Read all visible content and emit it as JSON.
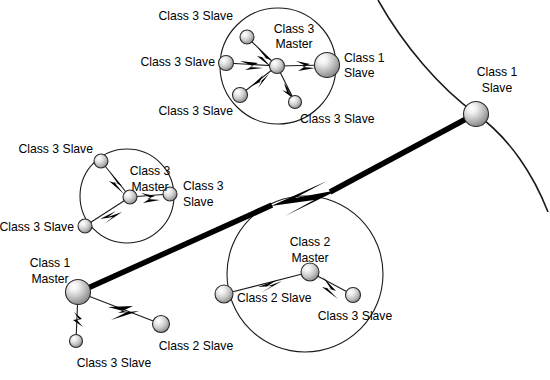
{
  "diagram": {
    "background_color": "#ffffff",
    "line_color": "#1a1a1a",
    "node_fill_light": "#f2f2f2",
    "node_fill_dark": "#8c8c8c",
    "node_stroke": "#2b2b2b",
    "width": 550,
    "height": 380
  },
  "piconets": [
    {
      "id": "piconet-top",
      "circle": {
        "cx": 278,
        "cy": 66,
        "r": 58
      },
      "nodes": [
        {
          "id": "top-master",
          "role": "Class 3 Master",
          "x": 277,
          "y": 66,
          "r": 7.5
        },
        {
          "id": "top-slave-upper",
          "role": "Class 3 Slave",
          "x": 247,
          "y": 37,
          "r": 7.0
        },
        {
          "id": "top-slave-left",
          "role": "Class 3 Slave",
          "x": 226,
          "y": 63,
          "r": 7.5
        },
        {
          "id": "top-slave-lower",
          "role": "Class 3 Slave",
          "x": 240,
          "y": 95,
          "r": 7.5
        },
        {
          "id": "top-slave-bottom",
          "role": "Class 3 Slave",
          "x": 295,
          "y": 102,
          "r": 6.5
        },
        {
          "id": "top-class1-slave",
          "role": "Class 1 Slave",
          "x": 327,
          "y": 65,
          "r": 12.5
        }
      ],
      "labels": [
        {
          "for": "top-master",
          "text": "Class 3\nMaster",
          "x": 294,
          "y": 30,
          "anchor": "mid"
        },
        {
          "for": "top-slave-upper",
          "text": "Class 3 Slave",
          "x": 232,
          "y": 17,
          "anchor": "end"
        },
        {
          "for": "top-slave-left",
          "text": "Class 3 Slave",
          "x": 214,
          "y": 63,
          "anchor": "end"
        },
        {
          "for": "top-slave-lower",
          "text": "Class 3 Slave",
          "x": 232,
          "y": 110,
          "anchor": "end"
        },
        {
          "for": "top-slave-bottom",
          "text": "Class 3 Slave",
          "x": 302,
          "y": 118,
          "anchor": "start"
        },
        {
          "for": "top-class1-slave",
          "text": "Class 1\nSlave",
          "x": 345,
          "y": 58,
          "anchor": "start"
        }
      ]
    },
    {
      "id": "piconet-middle-left",
      "circle": {
        "cx": 127,
        "cy": 196,
        "r": 47
      },
      "nodes": [
        {
          "id": "mid-master",
          "role": "Class 3 Master",
          "x": 130,
          "y": 197,
          "r": 7.0
        },
        {
          "id": "mid-slave-upper",
          "role": "Class 3 Slave",
          "x": 101,
          "y": 161,
          "r": 7.0
        },
        {
          "id": "mid-slave-right",
          "role": "Class 3 Slave",
          "x": 170,
          "y": 194,
          "r": 7.0
        },
        {
          "id": "mid-slave-lower",
          "role": "Class 3 Slave",
          "x": 85,
          "y": 226,
          "r": 7.0
        }
      ],
      "labels": [
        {
          "for": "mid-master",
          "text": "Class 3\nMaster",
          "x": 148,
          "y": 172,
          "anchor": "mid"
        },
        {
          "for": "mid-slave-upper",
          "text": "Class 3 Slave",
          "x": 92,
          "y": 150,
          "anchor": "end"
        },
        {
          "for": "mid-slave-right",
          "text": "Class 3\nSlave",
          "x": 183,
          "y": 188,
          "anchor": "start"
        },
        {
          "for": "mid-slave-lower",
          "text": "Class 3 Slave",
          "x": 74,
          "y": 227,
          "anchor": "end"
        }
      ]
    },
    {
      "id": "piconet-bottom-right",
      "circle": {
        "cx": 305,
        "cy": 274,
        "r": 78
      },
      "nodes": [
        {
          "id": "br-master",
          "role": "Class 2 Master",
          "x": 310,
          "y": 272,
          "r": 9.0
        },
        {
          "id": "br-class2-slave",
          "role": "Class 2 Slave",
          "x": 224,
          "y": 294,
          "r": 9.0
        },
        {
          "id": "br-class3-slave",
          "role": "Class 3 Slave",
          "x": 353,
          "y": 295,
          "r": 7.5
        }
      ],
      "labels": [
        {
          "for": "br-master",
          "text": "Class 2\nMaster",
          "x": 310,
          "y": 243,
          "anchor": "mid"
        },
        {
          "for": "br-class2-slave",
          "text": "Class 2 Slave",
          "x": 237,
          "y": 298,
          "anchor": "start"
        },
        {
          "for": "br-class3-slave",
          "text": "Class 3 Slave",
          "x": 354,
          "y": 315,
          "anchor": "mid"
        }
      ]
    }
  ],
  "standalone_nodes": [
    {
      "id": "class1-master",
      "role": "Class 1 Master",
      "x": 78,
      "y": 292,
      "r": 12.5,
      "label": "Class 1\nMaster",
      "lx": 50,
      "ly": 263,
      "anchor": "mid"
    },
    {
      "id": "bl-class2-slave",
      "role": "Class 2 Slave",
      "x": 161,
      "y": 324,
      "r": 8.5,
      "label": "Class 2 Slave",
      "lx": 164,
      "ly": 346,
      "anchor": "mid"
    },
    {
      "id": "bl-class3-slave",
      "role": "Class 3 Slave",
      "x": 76,
      "y": 341,
      "r": 6.5,
      "label": "Class 3 Slave",
      "lx": 76,
      "ly": 361,
      "anchor": "mid"
    },
    {
      "id": "right-class1-slave",
      "role": "Class 1 Slave",
      "x": 476,
      "y": 114,
      "r": 12.5,
      "label": "Class 1\nSlave",
      "lx": 495,
      "ly": 72,
      "anchor": "mid"
    }
  ],
  "big_arc": {
    "id": "scatternet-arc",
    "description": "Large circle boundary passing through the right Class 1 Slave",
    "path": "M 378 0 C 404 46 440 88 476 114 C 510 138 534 176 548 212"
  },
  "thick_links": [
    {
      "id": "class1-master-to-class1-slave",
      "from": "class1-master",
      "to": "right-class1-slave",
      "description": "Thick inter-piconet link with lightning bolt"
    }
  ],
  "thin_links": [
    {
      "from": "top-master",
      "to": "top-slave-upper"
    },
    {
      "from": "top-master",
      "to": "top-slave-left"
    },
    {
      "from": "top-master",
      "to": "top-slave-lower"
    },
    {
      "from": "top-master",
      "to": "top-slave-bottom"
    },
    {
      "from": "top-master",
      "to": "top-class1-slave"
    },
    {
      "from": "mid-master",
      "to": "mid-slave-upper"
    },
    {
      "from": "mid-master",
      "to": "mid-slave-right"
    },
    {
      "from": "mid-master",
      "to": "mid-slave-lower"
    },
    {
      "from": "br-master",
      "to": "br-class2-slave"
    },
    {
      "from": "br-master",
      "to": "br-class3-slave"
    },
    {
      "from": "class1-master",
      "to": "bl-class2-slave"
    },
    {
      "from": "class1-master",
      "to": "bl-class3-slave"
    }
  ],
  "legend_terms": {
    "class1_master": "Class 1 Master",
    "class1_slave": "Class 1 Slave",
    "class2_master": "Class 2 Master",
    "class2_slave": "Class 2 Slave",
    "class3_master": "Class 3 Master",
    "class3_slave": "Class 3 Slave"
  }
}
